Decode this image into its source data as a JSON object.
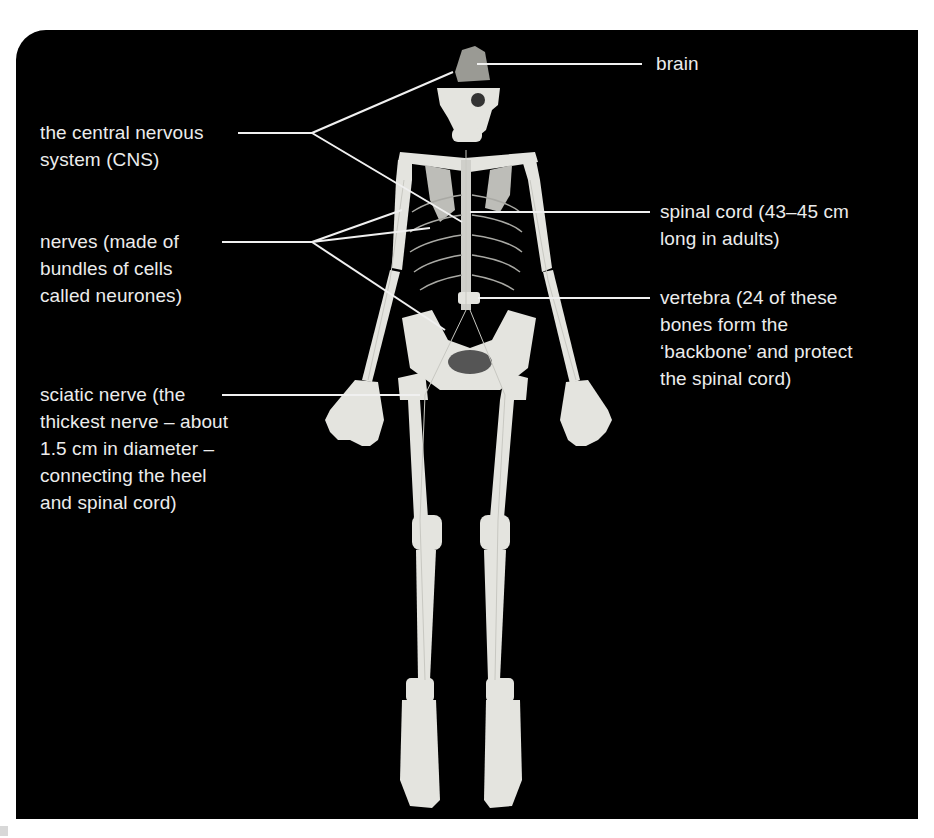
{
  "figure": {
    "background_color": "#000000",
    "label_color": "#ececec",
    "bone_color": "#e6e6e2",
    "leader_line_color": "#f0f0f0"
  },
  "labels": [
    {
      "id": "brain",
      "text": "brain"
    },
    {
      "id": "cns",
      "text": "the central nervous\nsystem (CNS)"
    },
    {
      "id": "spinal_cord",
      "text": "spinal cord (43–45 cm\nlong in adults)"
    },
    {
      "id": "nerves",
      "text": "nerves (made of\nbundles of cells\ncalled neurones)"
    },
    {
      "id": "vertebra",
      "text": "vertebra (24 of these\nbones form the\n‘backbone’ and protect\nthe spinal cord)"
    },
    {
      "id": "sciatic",
      "text": "sciatic nerve (the\nthickest nerve – about\n1.5 cm in diameter –\nconnecting the heel\nand spinal cord)"
    }
  ]
}
